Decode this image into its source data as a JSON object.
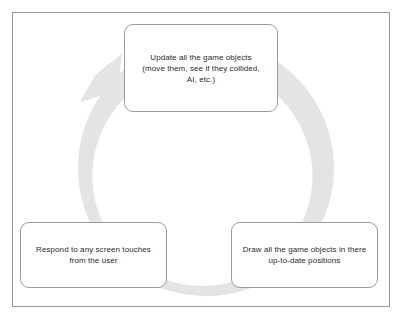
{
  "diagram": {
    "frame": {
      "border_color": "#9a9a9a",
      "background": "#ffffff"
    },
    "arrow": {
      "name": "circular-cycle-arrow",
      "color": "#e3e3e3",
      "direction": "counter-clockwise",
      "arrowhead_position": "upper-left"
    },
    "nodes": [
      {
        "id": "update",
        "label": "Update all the game objects\n(move them, see if they collided,\nAI, etc.)",
        "position": "top-center",
        "border_color": "#9b9b9b",
        "text_color": "#2b2b2b"
      },
      {
        "id": "draw",
        "label": "Draw all the game objects in there\nup-to-date positions",
        "position": "bottom-right",
        "border_color": "#9b9b9b",
        "text_color": "#2b2b2b"
      },
      {
        "id": "respond",
        "label": "Respond to any screen touches\nfrom the user",
        "position": "bottom-left",
        "border_color": "#9b9b9b",
        "text_color": "#2b2b2b"
      }
    ]
  }
}
